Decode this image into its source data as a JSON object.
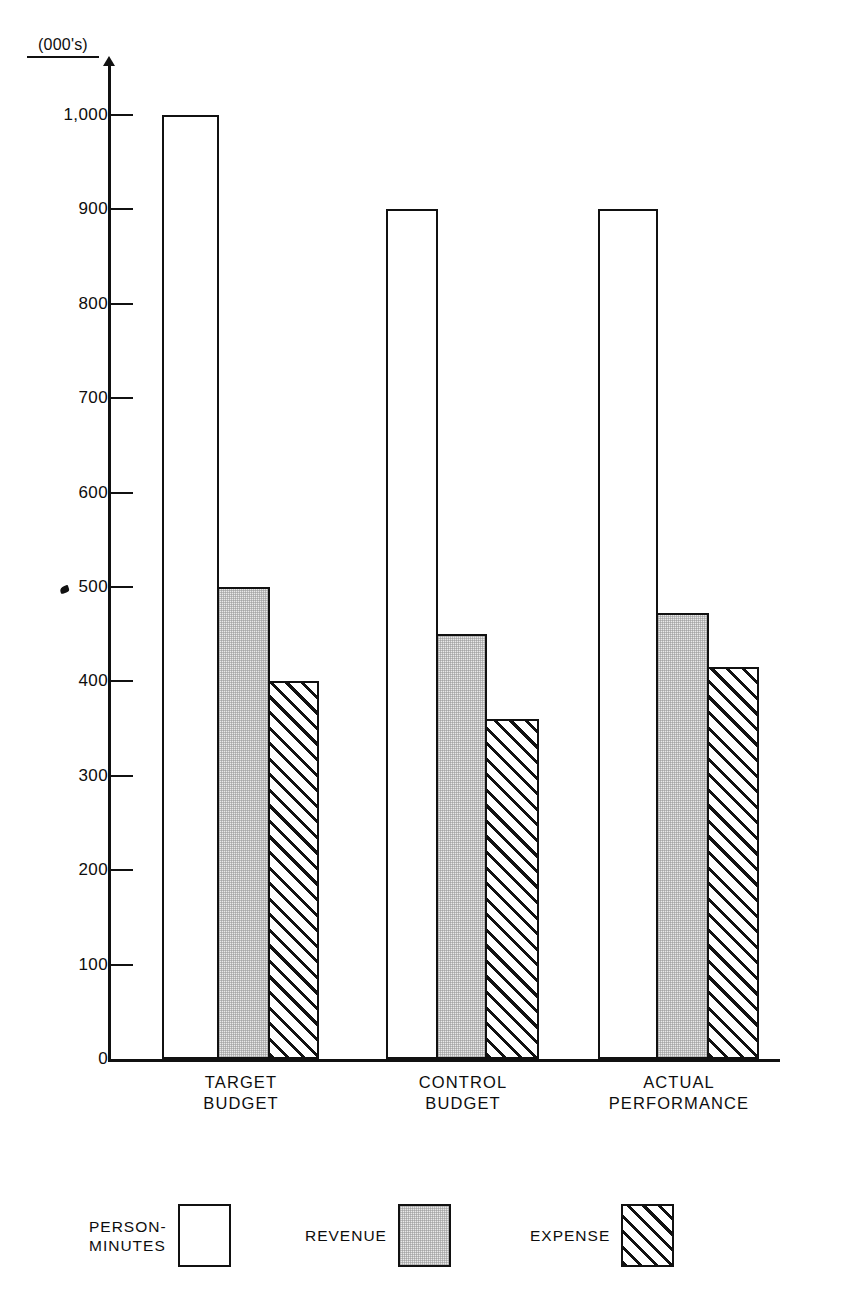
{
  "chart_data": {
    "type": "bar",
    "title": "",
    "subtitle": "",
    "xlabel": "",
    "ylabel": "(000's)",
    "unit_note": "(000's)",
    "categories": [
      "TARGET BUDGET",
      "CONTROL BUDGET",
      "ACTUAL PERFORMANCE"
    ],
    "category_lines": [
      [
        "TARGET",
        "BUDGET"
      ],
      [
        "CONTROL",
        "BUDGET"
      ],
      [
        "ACTUAL",
        "PERFORMANCE"
      ]
    ],
    "series": [
      {
        "name": "PERSON-MINUTES",
        "values": [
          1000,
          900,
          900
        ],
        "fill": "white"
      },
      {
        "name": "REVENUE",
        "values": [
          500,
          450,
          472
        ],
        "fill": "gray"
      },
      {
        "name": "EXPENSE",
        "values": [
          400,
          360,
          415
        ],
        "fill": "hatched"
      }
    ],
    "ylim": [
      0,
      1000
    ],
    "yticks": [
      0,
      100,
      200,
      300,
      400,
      500,
      600,
      700,
      800,
      900,
      1000
    ],
    "ytick_labels": [
      "0",
      "100",
      "200",
      "300",
      "400",
      "500",
      "600",
      "700",
      "800",
      "900",
      "1,000"
    ],
    "grid": false,
    "legend_position": "bottom",
    "colors": {
      "ink": "#111111",
      "person_minutes": "#ffffff",
      "revenue": "#e9e9e9",
      "expense": "#ffffff",
      "background": "#ffffff"
    }
  },
  "legend": {
    "items": [
      {
        "label_lines": [
          "PERSON-",
          "MINUTES"
        ],
        "label": "PERSON-MINUTES",
        "swatch": "white-swatch"
      },
      {
        "label_lines": [
          "REVENUE"
        ],
        "label": "REVENUE",
        "swatch": "gray-swatch"
      },
      {
        "label_lines": [
          "EXPENSE"
        ],
        "label": "EXPENSE",
        "swatch": "hatched-swatch"
      }
    ]
  }
}
